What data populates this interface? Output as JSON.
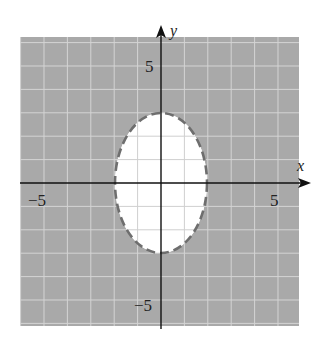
{
  "chart_data": {
    "type": "inequality_region",
    "title": "",
    "xlabel": "x",
    "ylabel": "y",
    "xlim": [
      -6,
      6
    ],
    "ylim": [
      -6.2,
      6.2
    ],
    "grid": true,
    "grid_step": 1,
    "tick_labels": {
      "x": [
        {
          "value": -5,
          "label": "−5"
        },
        {
          "value": 5,
          "label": "5"
        }
      ],
      "y": [
        {
          "value": 5,
          "label": "5"
        },
        {
          "value": -5,
          "label": "−5"
        }
      ]
    },
    "boundary": {
      "shape": "ellipse",
      "center": [
        0,
        0
      ],
      "semi_axis_x": 2,
      "semi_axis_y": 3,
      "equation": "x^2/4 + y^2/9 = 1",
      "style": "dashed"
    },
    "shaded_region": "outside",
    "inequality": "x^2/4 + y^2/9 > 1",
    "colors": {
      "shade": "#a9a9a9",
      "grid": "#d4d4d4",
      "inner_grid": "#cfcfcf",
      "boundary": "#6e6e6e",
      "axis": "#111111"
    }
  },
  "labels": {
    "x_axis": "x",
    "y_axis": "y",
    "x_neg5": "−5",
    "x_pos5": "5",
    "y_pos5": "5",
    "y_neg5": "−5"
  }
}
